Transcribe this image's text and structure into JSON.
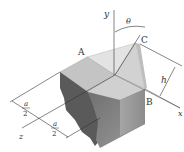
{
  "figure": {
    "labels": {
      "point_a": "A",
      "point_b": "B",
      "point_c": "C",
      "axis_x": "x",
      "axis_y": "y",
      "axis_z": "z",
      "angle": "θ",
      "height": "h",
      "dim1_num": "a",
      "dim1_den": "2",
      "dim2_num": "a",
      "dim2_den": "2"
    },
    "colors": {
      "top_face": "#c9c9c9",
      "front_face": "#8a8a8a",
      "side_face": "#b0b0b0",
      "wedge": "#dcdcdc",
      "line": "#333333"
    }
  }
}
